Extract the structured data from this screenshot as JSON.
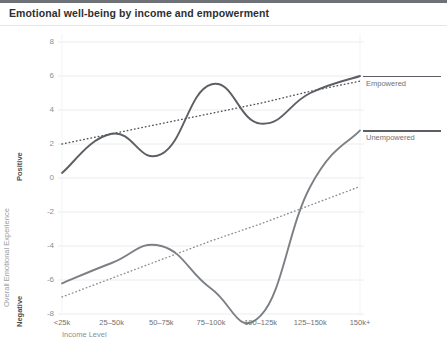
{
  "header": {
    "title": "Emotional well-being by income and empowerment"
  },
  "chart_data": {
    "type": "line",
    "title": "Emotional well-being by income and empowerment",
    "xlabel": "Income Level",
    "ylabel": "Overall Emotional Experience",
    "ylabel_positive": "Positive",
    "ylabel_negative": "Negative",
    "categories": [
      "<25k",
      "25–50k",
      "50–75k",
      "75–100k",
      "100–125k",
      "125–150k",
      "150k+"
    ],
    "ylim": [
      -8,
      8
    ],
    "yticks": [
      "8",
      "6",
      "4",
      "2",
      "0",
      "-2",
      "-4",
      "-6",
      "-8"
    ],
    "ytick_values": [
      8,
      6,
      4,
      2,
      0,
      -2,
      -4,
      -6,
      -8
    ],
    "grid": true,
    "legend_position": "right",
    "series": [
      {
        "name": "Empowered",
        "style": "solid",
        "color": "#5c6065",
        "values": [
          0.3,
          2.6,
          1.4,
          5.5,
          3.2,
          5.0,
          6.0
        ]
      },
      {
        "name": "Unempowered",
        "style": "solid",
        "color": "#7c8085",
        "values": [
          -6.2,
          -5.0,
          -4.0,
          -6.5,
          -8.1,
          -0.5,
          2.8
        ]
      },
      {
        "name": "Empowered trend",
        "style": "dotted",
        "color": "#55585c",
        "values": [
          2.0,
          2.6,
          3.2,
          3.8,
          4.4,
          5.1,
          5.7
        ]
      },
      {
        "name": "Unempowered trend",
        "style": "dotted",
        "color": "#8b8f93",
        "values": [
          -7.0,
          -5.9,
          -4.8,
          -3.7,
          -2.7,
          -1.6,
          -0.5
        ]
      }
    ],
    "annotations": [
      {
        "text": "Empowered",
        "at_value": 6.0,
        "at_category": "150k+"
      },
      {
        "text": "Unempowered",
        "at_value": 2.8,
        "at_category": "150k+"
      }
    ]
  }
}
